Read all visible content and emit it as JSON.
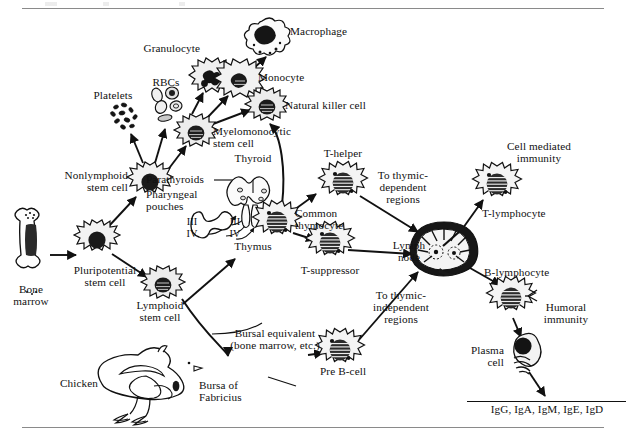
{
  "figure": {
    "background_color": "#ffffff",
    "ink_color": "#111111",
    "rule_color": "#8a8a8a"
  },
  "labels": {
    "bone_marrow": "Bone\nmarrow",
    "pluripotential_stem_cell": "Pluripotential\nstem cell",
    "nonlymphoid_stem_cell": "Nonlymphoid\nstem cell",
    "lymphoid_stem_cell": "Lymphoid\nstem cell",
    "platelets": "Platelets",
    "rbcs": "RBCs",
    "myelomonocytic_stem_cell": "Myelomonocytic\nstem cell",
    "granulocyte": "Granulocyte",
    "monocyte": "Monocyte",
    "macrophage": "Macrophage",
    "natural_killer_cell": "Natural killer cell",
    "parathyroids": "Parathyroids",
    "thyroid": "Thyroid",
    "pharyngeal_pouches": "Pharyngeal\npouches",
    "pouch_iii_left": "III",
    "pouch_iv_left": "IV",
    "pouch_iii_right": "III",
    "pouch_iv_right": "IV",
    "thymus": "Thymus",
    "common_thymocyte": "Common\nthymocyte",
    "t_helper": "T-helper",
    "t_suppressor": "T-suppressor",
    "to_thymic_dependent_regions": "To thymic-\ndependent\nregions",
    "to_thymic_independent_regions": "To thymic-\nindependent\nregions",
    "lymph_node": "Lymph\nnode",
    "t_lymphocyte": "T-lymphocyte",
    "cell_mediated_immunity": "Cell mediated\nimmunity",
    "b_lymphocyte": "B-lymphocyte",
    "humoral_immunity": "Humoral\nimmunity",
    "plasma_cell": "Plasma\ncell",
    "immunoglobulins": "IgG, IgA, IgM, IgE, IgD",
    "bursal_equivalent": "Bursal equivalent\n(bone marrow, etc.)",
    "pre_b_cell": "Pre B-cell",
    "chicken": "Chicken",
    "bursa_of_fabricius": "Bursa of\nFabricius"
  },
  "nodes": [
    {
      "name": "bone-marrow",
      "x": 31,
      "y": 255,
      "type": "bone"
    },
    {
      "name": "pluripotential-stem-cell",
      "x": 97,
      "y": 240,
      "type": "cell-plain"
    },
    {
      "name": "nonlymphoid-stem-cell",
      "x": 150,
      "y": 182,
      "type": "cell-plain"
    },
    {
      "name": "lymphoid-stem-cell",
      "x": 163,
      "y": 285,
      "type": "cell-dark"
    },
    {
      "name": "platelets",
      "x": 126,
      "y": 118,
      "type": "platelets"
    },
    {
      "name": "rbcs",
      "x": 166,
      "y": 106,
      "type": "rbcs"
    },
    {
      "name": "myelomonocytic-stem-cell",
      "x": 196,
      "y": 133,
      "type": "cell-dark"
    },
    {
      "name": "granulocyte",
      "x": 212,
      "y": 78,
      "type": "granulocyte"
    },
    {
      "name": "monocyte",
      "x": 240,
      "y": 82,
      "type": "monocyte"
    },
    {
      "name": "macrophage",
      "x": 266,
      "y": 41,
      "type": "macrophage"
    },
    {
      "name": "natural-killer-cell",
      "x": 267,
      "y": 107,
      "type": "cell-dark"
    },
    {
      "name": "thyroid-parathyroid",
      "x": 253,
      "y": 192,
      "type": "thyroid"
    },
    {
      "name": "pharyngeal-pouches",
      "x": 214,
      "y": 222,
      "type": "pouches"
    },
    {
      "name": "common-thymocyte",
      "x": 277,
      "y": 222,
      "type": "cell-striped"
    },
    {
      "name": "t-helper",
      "x": 343,
      "y": 183,
      "type": "cell-striped"
    },
    {
      "name": "t-suppressor",
      "x": 330,
      "y": 243,
      "type": "cell-striped"
    },
    {
      "name": "lymph-node",
      "x": 444,
      "y": 248,
      "type": "lymphnode"
    },
    {
      "name": "t-lymphocyte",
      "x": 497,
      "y": 184,
      "type": "cell-striped"
    },
    {
      "name": "b-lymphocyte",
      "x": 511,
      "y": 298,
      "type": "cell-b"
    },
    {
      "name": "plasma-cell",
      "x": 524,
      "y": 355,
      "type": "plasma"
    },
    {
      "name": "pre-b-cell",
      "x": 340,
      "y": 350,
      "type": "cell-striped"
    },
    {
      "name": "chicken-bursa",
      "x": 160,
      "y": 382,
      "type": "chicken"
    }
  ],
  "arrows": [
    {
      "from": "bone-marrow",
      "to": "pluripotential-stem-cell"
    },
    {
      "from": "pluripotential-stem-cell",
      "to": "nonlymphoid-stem-cell"
    },
    {
      "from": "pluripotential-stem-cell",
      "to": "lymphoid-stem-cell"
    },
    {
      "from": "nonlymphoid-stem-cell",
      "to": "platelets"
    },
    {
      "from": "nonlymphoid-stem-cell",
      "to": "rbcs"
    },
    {
      "from": "nonlymphoid-stem-cell",
      "to": "myelomonocytic-stem-cell"
    },
    {
      "from": "myelomonocytic-stem-cell",
      "to": "granulocyte"
    },
    {
      "from": "myelomonocytic-stem-cell",
      "to": "monocyte"
    },
    {
      "from": "myelomonocytic-stem-cell",
      "to": "natural-killer-cell"
    },
    {
      "from": "monocyte",
      "to": "macrophage"
    },
    {
      "from": "common-thymocyte",
      "to": "natural-killer-cell"
    },
    {
      "from": "lymphoid-stem-cell",
      "to": "thymus"
    },
    {
      "from": "lymphoid-stem-cell",
      "to": "bursa-of-fabricius"
    },
    {
      "from": "lymphoid-stem-cell",
      "to": "bursal-equivalent"
    },
    {
      "from": "common-thymocyte",
      "to": "t-helper"
    },
    {
      "from": "common-thymocyte",
      "to": "t-suppressor"
    },
    {
      "from": "t-helper",
      "to": "lymph-node"
    },
    {
      "from": "t-suppressor",
      "to": "lymph-node"
    },
    {
      "from": "pre-b-cell",
      "to": "lymph-node"
    },
    {
      "from": "bursal-equivalent",
      "to": "pre-b-cell"
    },
    {
      "from": "lymph-node",
      "to": "t-lymphocyte"
    },
    {
      "from": "lymph-node",
      "to": "b-lymphocyte"
    },
    {
      "from": "b-lymphocyte",
      "to": "plasma-cell"
    },
    {
      "from": "plasma-cell",
      "to": "immunoglobulins"
    }
  ]
}
